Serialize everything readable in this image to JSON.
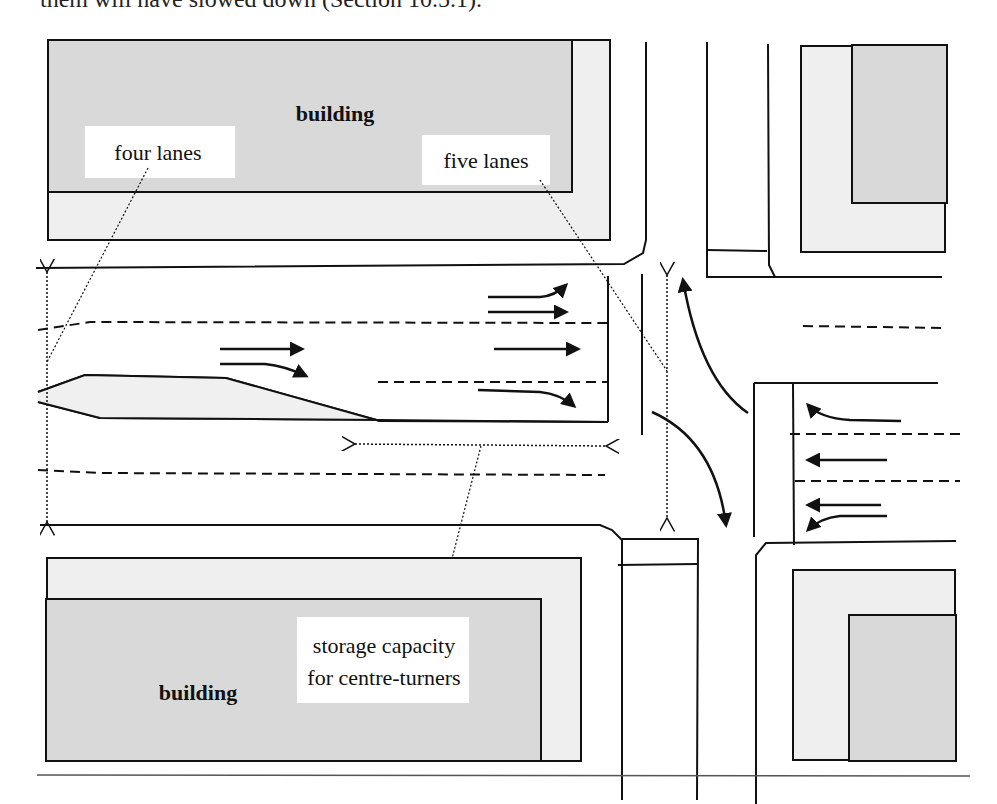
{
  "page": {
    "top_text": "them will have slowed down (Section 10.5.1)."
  },
  "diagram": {
    "labels": {
      "building_top": "building",
      "building_bottom": "building",
      "four_lanes": "four lanes",
      "five_lanes": "five lanes",
      "storage_line1": "storage capacity",
      "storage_line2": "for centre-turners"
    },
    "colors": {
      "ink": "#111111",
      "building_fill": "#d9d9d9",
      "lot_fill": "#efefef",
      "label_bg": "#ffffff",
      "island_fill": "#f0f0f0"
    }
  }
}
